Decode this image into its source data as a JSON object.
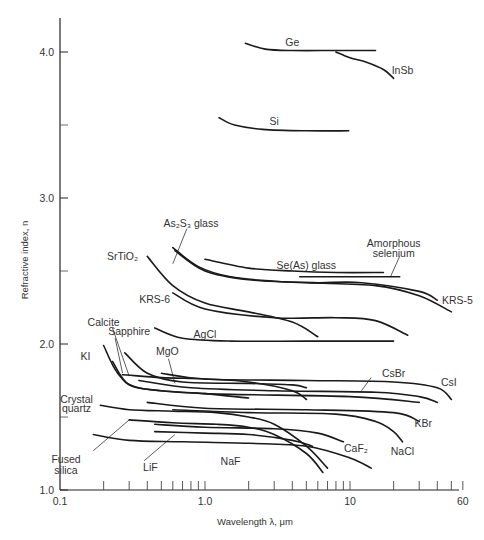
{
  "chart_data": {
    "type": "line",
    "title": "",
    "xlabel": "Wavelength λ, μm",
    "ylabel": "Refractive index, n",
    "xscale": "log",
    "xlim": [
      0.1,
      60
    ],
    "ylim": [
      1.0,
      4.3
    ],
    "grid": false,
    "legend": "inline labels",
    "x_tick_labels": [
      "0.1",
      "1.0",
      "10",
      "60"
    ],
    "y_tick_labels": [
      "1.0",
      "2.0",
      "3.0",
      "4.0"
    ],
    "x_minor_ticks": [
      0.2,
      0.3,
      0.4,
      0.5,
      0.6,
      0.7,
      0.8,
      0.9,
      1,
      2,
      3,
      4,
      5,
      6,
      7,
      8,
      9,
      10,
      20,
      30,
      40,
      50,
      60
    ],
    "y_minor_ticks": [
      1.5,
      2.5,
      3.5
    ],
    "series": [
      {
        "name": "Ge",
        "points": [
          [
            1.9,
            4.06
          ],
          [
            2.6,
            4.02
          ],
          [
            4,
            4.01
          ],
          [
            8,
            4.01
          ],
          [
            15,
            4.01
          ]
        ],
        "label": {
          "text": "Ge",
          "at": [
            4.0,
            4.07
          ]
        }
      },
      {
        "name": "InSb",
        "points": [
          [
            8,
            4.0
          ],
          [
            10,
            3.96
          ],
          [
            13,
            3.93
          ],
          [
            17,
            3.88
          ],
          [
            20,
            3.82
          ]
        ],
        "label": {
          "text": "InSb",
          "at": [
            23,
            3.88
          ]
        }
      },
      {
        "name": "Si",
        "points": [
          [
            1.25,
            3.55
          ],
          [
            1.6,
            3.5
          ],
          [
            2.5,
            3.47
          ],
          [
            5,
            3.46
          ],
          [
            9.8,
            3.46
          ]
        ],
        "label": {
          "text": "Si",
          "at": [
            3.0,
            3.53
          ]
        }
      },
      {
        "name": "As2S3 glass",
        "points": [
          [
            0.6,
            2.66
          ],
          [
            0.9,
            2.53
          ],
          [
            1.5,
            2.46
          ],
          [
            3,
            2.43
          ],
          [
            6,
            2.42
          ],
          [
            12,
            2.42
          ],
          [
            30,
            2.36
          ],
          [
            40,
            2.3
          ]
        ],
        "label": {
          "text": "As₂S₃ glass",
          "at": [
            0.8,
            2.83
          ]
        }
      },
      {
        "name": "Se(As) glass",
        "points": [
          [
            1.0,
            2.58
          ],
          [
            2,
            2.52
          ],
          [
            4,
            2.5
          ],
          [
            8,
            2.49
          ],
          [
            17,
            2.49
          ]
        ],
        "label": {
          "text": "Se(As) glass",
          "at": [
            5,
            2.54
          ]
        }
      },
      {
        "name": "Amorphous selenium",
        "points": [
          [
            4.5,
            2.46
          ],
          [
            10,
            2.46
          ],
          [
            22,
            2.46
          ]
        ],
        "label": {
          "text": "Amorphous",
          "at": [
            20,
            2.69
          ]
        },
        "label2": {
          "text": "selenium",
          "at": [
            20,
            2.62
          ]
        }
      },
      {
        "name": "KRS-5",
        "points": [
          [
            0.62,
            2.64
          ],
          [
            1,
            2.5
          ],
          [
            2,
            2.44
          ],
          [
            5,
            2.42
          ],
          [
            15,
            2.4
          ],
          [
            30,
            2.33
          ],
          [
            50,
            2.22
          ]
        ],
        "label": {
          "text": "KRS-5",
          "at": [
            55,
            2.3
          ]
        }
      },
      {
        "name": "SrTiO2",
        "points": [
          [
            0.4,
            2.6
          ],
          [
            0.6,
            2.4
          ],
          [
            1,
            2.28
          ],
          [
            2,
            2.22
          ],
          [
            4,
            2.15
          ],
          [
            6,
            2.05
          ]
        ],
        "label": {
          "text": "SrTiO₂",
          "at": [
            0.27,
            2.6
          ]
        }
      },
      {
        "name": "KRS-6",
        "points": [
          [
            0.6,
            2.35
          ],
          [
            1,
            2.24
          ],
          [
            3,
            2.18
          ],
          [
            8,
            2.18
          ],
          [
            15,
            2.16
          ],
          [
            25,
            2.06
          ]
        ],
        "label": {
          "text": "KRS-6",
          "at": [
            0.45,
            2.31
          ]
        }
      },
      {
        "name": "AgCl",
        "points": [
          [
            0.45,
            2.11
          ],
          [
            0.7,
            2.04
          ],
          [
            1.5,
            2.02
          ],
          [
            5,
            2.02
          ],
          [
            20,
            2.02
          ]
        ],
        "label": {
          "text": "AgCl",
          "at": [
            1.0,
            2.07
          ]
        }
      },
      {
        "name": "CsI",
        "points": [
          [
            0.5,
            1.8
          ],
          [
            1,
            1.76
          ],
          [
            5,
            1.75
          ],
          [
            20,
            1.74
          ],
          [
            40,
            1.7
          ],
          [
            50,
            1.62
          ]
        ],
        "label": {
          "text": "CsI",
          "at": [
            48,
            1.74
          ]
        }
      },
      {
        "name": "CsBr",
        "points": [
          [
            0.35,
            1.75
          ],
          [
            0.8,
            1.7
          ],
          [
            3,
            1.68
          ],
          [
            15,
            1.67
          ],
          [
            30,
            1.64
          ],
          [
            40,
            1.6
          ]
        ],
        "label": {
          "text": "CsBr",
          "at": [
            20,
            1.8
          ]
        }
      },
      {
        "name": "KI",
        "points": [
          [
            0.2,
            1.99
          ],
          [
            0.25,
            1.8
          ],
          [
            0.35,
            1.7
          ],
          [
            1,
            1.66
          ],
          [
            10,
            1.64
          ],
          [
            30,
            1.6
          ]
        ],
        "label": {
          "text": "KI",
          "at": [
            0.15,
            1.92
          ]
        }
      },
      {
        "name": "Calcite",
        "points": [
          [
            0.23,
            1.88
          ],
          [
            0.3,
            1.72
          ],
          [
            0.5,
            1.68
          ],
          [
            1,
            1.66
          ],
          [
            2,
            1.63
          ]
        ],
        "label": {
          "text": "Calcite",
          "at": [
            0.2,
            2.15
          ]
        }
      },
      {
        "name": "Sapphire",
        "points": [
          [
            0.27,
            1.79
          ],
          [
            0.5,
            1.77
          ],
          [
            1,
            1.76
          ],
          [
            2,
            1.74
          ],
          [
            4,
            1.68
          ],
          [
            5,
            1.62
          ]
        ],
        "label": {
          "text": "Sapphire",
          "at": [
            0.3,
            2.09
          ]
        }
      },
      {
        "name": "MgO",
        "points": [
          [
            0.28,
            1.94
          ],
          [
            0.4,
            1.8
          ],
          [
            0.7,
            1.74
          ],
          [
            2,
            1.73
          ],
          [
            4,
            1.72
          ],
          [
            5,
            1.7
          ]
        ],
        "label": {
          "text": "MgO",
          "at": [
            0.55,
            1.95
          ]
        }
      },
      {
        "name": "KBr",
        "points": [
          [
            0.4,
            1.6
          ],
          [
            1,
            1.56
          ],
          [
            5,
            1.55
          ],
          [
            20,
            1.53
          ],
          [
            30,
            1.47
          ]
        ],
        "label": {
          "text": "KBr",
          "at": [
            32,
            1.46
          ]
        }
      },
      {
        "name": "Crystal quartz",
        "points": [
          [
            0.19,
            1.58
          ],
          [
            0.3,
            1.55
          ],
          [
            0.6,
            1.54
          ],
          [
            1.2,
            1.53
          ],
          [
            2,
            1.5
          ],
          [
            3,
            1.45
          ],
          [
            5,
            1.3
          ],
          [
            7,
            1.15
          ]
        ],
        "label": {
          "text": "Crystal",
          "at": [
            0.13,
            1.62
          ]
        },
        "label2": {
          "text": "quartz",
          "at": [
            0.13,
            1.56
          ]
        }
      },
      {
        "name": "NaCl",
        "points": [
          [
            0.6,
            1.55
          ],
          [
            2,
            1.53
          ],
          [
            8,
            1.52
          ],
          [
            15,
            1.47
          ],
          [
            20,
            1.4
          ],
          [
            23,
            1.33
          ]
        ],
        "label": {
          "text": "NaCl",
          "at": [
            23,
            1.27
          ]
        }
      },
      {
        "name": "CaF2",
        "points": [
          [
            0.45,
            1.45
          ],
          [
            1,
            1.43
          ],
          [
            3,
            1.42
          ],
          [
            6,
            1.39
          ],
          [
            9,
            1.33
          ]
        ],
        "label": {
          "text": "CaF₂",
          "at": [
            11,
            1.29
          ]
        }
      },
      {
        "name": "Fused silica",
        "points": [
          [
            0.3,
            1.48
          ],
          [
            0.6,
            1.46
          ],
          [
            1.2,
            1.45
          ],
          [
            2,
            1.43
          ],
          [
            3,
            1.38
          ],
          [
            5,
            1.25
          ],
          [
            6.5,
            1.12
          ]
        ],
        "label": {
          "text": "Fused",
          "at": [
            0.11,
            1.21
          ]
        },
        "label2": {
          "text": "silica",
          "at": [
            0.11,
            1.14
          ]
        }
      },
      {
        "name": "LiF",
        "points": [
          [
            0.45,
            1.4
          ],
          [
            1,
            1.39
          ],
          [
            2,
            1.38
          ],
          [
            4,
            1.34
          ],
          [
            5.5,
            1.3
          ]
        ],
        "label": {
          "text": "LiF",
          "at": [
            0.42,
            1.16
          ]
        }
      },
      {
        "name": "NaF",
        "points": [
          [
            0.17,
            1.38
          ],
          [
            0.3,
            1.34
          ],
          [
            0.7,
            1.33
          ],
          [
            2,
            1.32
          ],
          [
            5,
            1.3
          ],
          [
            10,
            1.22
          ],
          [
            14,
            1.15
          ]
        ],
        "label": {
          "text": "NaF",
          "at": [
            1.5,
            1.2
          ]
        }
      }
    ],
    "leaders": [
      {
        "for": "As2S3 glass",
        "from": [
          0.75,
          2.79
        ],
        "to": [
          0.6,
          2.55
        ]
      },
      {
        "for": "Amorphous selenium",
        "from": [
          22,
          2.6
        ],
        "to": [
          19,
          2.46
        ]
      },
      {
        "for": "Calcite",
        "from": [
          0.23,
          2.11
        ],
        "to": [
          0.3,
          1.78
        ]
      },
      {
        "for": "Sapphire",
        "from": [
          0.24,
          2.04
        ],
        "to": [
          0.27,
          1.8
        ]
      },
      {
        "for": "MgO",
        "from": [
          0.56,
          1.9
        ],
        "to": [
          0.62,
          1.73
        ]
      },
      {
        "for": "CsBr",
        "from": [
          14,
          1.77
        ],
        "to": [
          12,
          1.68
        ]
      },
      {
        "for": "Fused silica",
        "from": [
          0.17,
          1.27
        ],
        "to": [
          0.3,
          1.48
        ]
      },
      {
        "for": "LiF",
        "from": [
          0.38,
          1.2
        ],
        "to": [
          0.62,
          1.38
        ]
      }
    ]
  }
}
